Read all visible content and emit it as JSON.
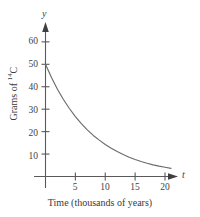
{
  "chart_data": {
    "type": "line",
    "title": "",
    "subtitle": "",
    "xlabel": "Time (thousands of years)",
    "ylabel": "Grams of 14C",
    "ylabel_base": "Grams of ",
    "ylabel_superscript": "14",
    "ylabel_suffix": "C",
    "x_axis_variable": "t",
    "y_axis_variable": "y",
    "xlim": [
      0,
      22
    ],
    "ylim": [
      0,
      66
    ],
    "xticks": [
      5,
      10,
      15,
      20
    ],
    "xtick_labels": [
      "5",
      "10",
      "15",
      "20"
    ],
    "yticks": [
      10,
      20,
      30,
      40,
      50,
      60
    ],
    "ytick_labels": [
      "10",
      "20",
      "30",
      "40",
      "50",
      "60"
    ],
    "grid": false,
    "legend": false,
    "legend_position": "none",
    "series": [
      {
        "name": "Carbon-14 decay",
        "x": [
          0,
          1,
          2,
          3,
          4,
          5,
          6,
          7,
          8,
          9,
          10,
          11,
          12,
          13,
          14,
          15,
          16,
          17,
          18,
          19,
          20,
          21
        ],
        "values": [
          50.0,
          44.1,
          38.9,
          34.3,
          30.3,
          26.7,
          23.6,
          20.8,
          18.3,
          16.2,
          14.3,
          12.6,
          11.1,
          9.8,
          8.6,
          7.6,
          6.7,
          5.9,
          5.2,
          4.6,
          4.1,
          3.6
        ]
      }
    ],
    "annotations": [],
    "colors": {
      "curve": "#6b6b6b",
      "axis": "#5a5a5a",
      "text": "#3a3a3a",
      "background": "#ffffff"
    }
  }
}
